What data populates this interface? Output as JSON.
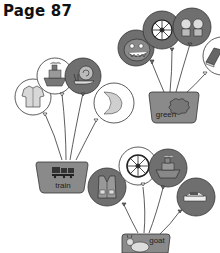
{
  "page": {
    "title": "Page 87"
  },
  "groups": [
    {
      "basket_label": "train",
      "balloons": [
        {
          "icon": "shirt-icon",
          "shade": "light"
        },
        {
          "icon": "boat-icon",
          "shade": "light"
        },
        {
          "icon": "snail-icon",
          "shade": "dark"
        },
        {
          "icon": "moon-icon",
          "shade": "light"
        }
      ]
    },
    {
      "basket_label": "green",
      "balloons": [
        {
          "icon": "monster-face-icon",
          "shade": "dark"
        },
        {
          "icon": "wheel-icon",
          "shade": "dark"
        },
        {
          "icon": "twins-icon",
          "shade": "dark"
        },
        {
          "icon": "book-icon",
          "shade": "light"
        }
      ]
    },
    {
      "basket_label": "goat",
      "balloons": [
        {
          "icon": "vest-icon",
          "shade": "dark"
        },
        {
          "icon": "wheel-icon",
          "shade": "light"
        },
        {
          "icon": "boat-icon",
          "shade": "dark"
        },
        {
          "icon": "cake-icon",
          "shade": "dark"
        }
      ]
    }
  ],
  "colors": {
    "dark_balloon": "#6f6f6f",
    "light_balloon": "#ffffff",
    "basket": "#8a8a8a",
    "line": "#333333"
  }
}
